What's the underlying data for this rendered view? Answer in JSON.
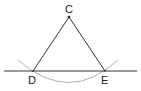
{
  "diagram": {
    "type": "geometric-construction",
    "colors": {
      "line": "#333333",
      "arc": "#b0b0b0",
      "text": "#222222",
      "background": "#ffffff"
    },
    "points": [
      {
        "label": "C",
        "x": 69,
        "y": 17
      },
      {
        "label": "D",
        "x": 33,
        "y": 71
      },
      {
        "label": "E",
        "x": 105,
        "y": 71
      }
    ],
    "labels": {
      "C": "C",
      "D": "D",
      "E": "E"
    },
    "baseline": {
      "x1": 4,
      "y1": 71,
      "x2": 137,
      "y2": 71
    },
    "segments": [
      {
        "from": "C",
        "to": "D"
      },
      {
        "from": "C",
        "to": "E"
      }
    ],
    "arc": {
      "center": "C",
      "through": [
        "D",
        "E"
      ]
    }
  }
}
